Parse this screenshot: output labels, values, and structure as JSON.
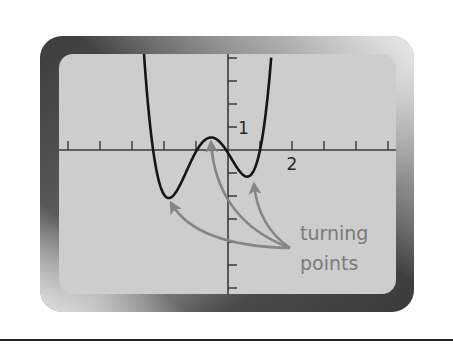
{
  "figure": {
    "colors": {
      "background": "#ffffff",
      "bezel_dark": "#3f3f3f",
      "bezel_mid": "#8a8a8a",
      "bezel_light": "#e6e6e6",
      "screen": "#cdcdcd",
      "axis": "#3a3a3a",
      "curve": "#151515",
      "arrow": "#858585",
      "annotation_text": "#7a7a7a",
      "rule": "#222222"
    }
  },
  "screen": {
    "origin_px": [
      228,
      150
    ],
    "unit_px": {
      "x": 32,
      "y": 23
    },
    "window": {
      "xmin": -5,
      "xmax": 5,
      "ymin": -6,
      "ymax": 4
    },
    "x_ticks": [
      -5,
      -4,
      -3,
      -2,
      -1,
      1,
      2,
      3,
      4,
      5
    ],
    "y_ticks": [
      -6,
      -5,
      -4,
      -3,
      -2,
      -1,
      1,
      2,
      3,
      4
    ],
    "x_tick_label": {
      "value": 2,
      "text": "2"
    },
    "y_tick_label": {
      "value": 1,
      "text": "1"
    }
  },
  "curve": {
    "type": "quartic",
    "scale": 0.95,
    "roots": [
      -2.34,
      -0.97,
      -0.06,
      1.0
    ],
    "x_range": [
      -2.7,
      1.35
    ]
  },
  "annotation": {
    "line1": "turning",
    "line2": "points",
    "arrow_origin_px": [
      290,
      248
    ],
    "turning_points": [
      {
        "name": "left-minimum",
        "x": -1.84,
        "y": -2.0,
        "tip_px": [
          171,
          203
        ]
      },
      {
        "name": "local-maximum",
        "x": -0.53,
        "y": 0.62,
        "tip_px": [
          211,
          142
        ]
      },
      {
        "name": "right-minimum",
        "x": 0.63,
        "y": -1.09,
        "tip_px": [
          254,
          184
        ]
      }
    ]
  },
  "chart_data": {
    "type": "line",
    "title": "",
    "xlabel": "",
    "ylabel": "",
    "x_tick_labels": [
      "2"
    ],
    "y_tick_labels": [
      "1"
    ],
    "xlim": [
      -5,
      5
    ],
    "ylim": [
      -6,
      4
    ],
    "grid": false,
    "series": [
      {
        "name": "f(x) quartic",
        "roots": [
          -2.34,
          -0.97,
          -0.06,
          1.0
        ],
        "turning_points": [
          [
            -1.84,
            -2.0
          ],
          [
            -0.53,
            0.62
          ],
          [
            0.63,
            -1.09
          ]
        ]
      }
    ],
    "annotations": [
      "turning points"
    ]
  }
}
